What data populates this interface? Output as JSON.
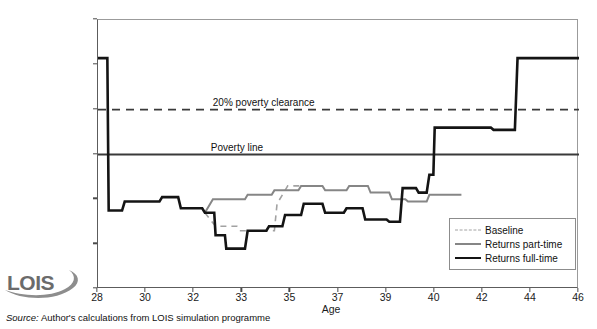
{
  "figure": {
    "title_partial": "",
    "source_prefix": "Source:",
    "source_text": "Author's calculations from LOIS simulation programme",
    "logo_text": "LOIS"
  },
  "legend": {
    "position": "bottom-right",
    "items": [
      {
        "label": "Baseline",
        "style": "dashed",
        "color": "#a2a2a2"
      },
      {
        "label": "Returns part-time",
        "style": "solid",
        "color": "#868686"
      },
      {
        "label": "Returns full-time",
        "style": "solid",
        "color": "#141414"
      }
    ]
  },
  "annotations": [
    {
      "text": "20% poverty clearance",
      "x": 34.2,
      "y": 123.5
    },
    {
      "text": "Poverty line",
      "x": 33.2,
      "y": 103.5
    }
  ],
  "chart_data": {
    "type": "line",
    "title": "",
    "xlabel": "Age",
    "ylabel": "% of AHC poverty line",
    "xlim": [
      28,
      46
    ],
    "ylim": [
      40,
      160
    ],
    "yticks": [
      40,
      60,
      80,
      100,
      120,
      140,
      160
    ],
    "xticks": [
      28,
      30,
      32,
      33,
      35,
      37,
      39,
      40,
      42,
      44,
      46
    ],
    "xtick_labels": [
      "28",
      "30",
      "32",
      "33",
      "35",
      "37",
      "39",
      "40",
      "42",
      "44",
      "46"
    ],
    "grid": false,
    "legend_position": "bottom-right",
    "reference_lines": [
      {
        "name": "20% poverty clearance",
        "value": 120,
        "style": "dashed",
        "color": "#3a3a3a"
      },
      {
        "name": "Poverty line",
        "value": 100,
        "style": "solid",
        "color": "#3a3a3a"
      }
    ],
    "series": [
      {
        "name": "Returns full-time",
        "color": "#141414",
        "style": "solid",
        "width": 2.6,
        "points": [
          [
            28.0,
            143
          ],
          [
            28.35,
            143
          ],
          [
            28.4,
            75
          ],
          [
            28.9,
            75
          ],
          [
            29.0,
            79
          ],
          [
            30.3,
            79
          ],
          [
            30.4,
            81
          ],
          [
            31.0,
            81
          ],
          [
            31.1,
            76
          ],
          [
            31.9,
            76
          ],
          [
            32.0,
            74
          ],
          [
            32.35,
            74
          ],
          [
            32.4,
            64
          ],
          [
            32.75,
            64
          ],
          [
            32.8,
            58
          ],
          [
            33.5,
            58
          ],
          [
            33.6,
            66
          ],
          [
            34.3,
            66
          ],
          [
            34.4,
            68
          ],
          [
            34.9,
            68
          ],
          [
            35.0,
            73
          ],
          [
            35.6,
            73
          ],
          [
            35.7,
            78
          ],
          [
            36.4,
            78
          ],
          [
            36.5,
            74
          ],
          [
            37.2,
            74
          ],
          [
            37.3,
            76
          ],
          [
            37.9,
            76
          ],
          [
            38.0,
            71
          ],
          [
            38.8,
            71
          ],
          [
            38.9,
            70
          ],
          [
            39.3,
            70
          ],
          [
            39.4,
            85
          ],
          [
            39.9,
            85
          ],
          [
            40.0,
            83
          ],
          [
            40.3,
            83
          ],
          [
            40.4,
            91
          ],
          [
            40.55,
            91
          ],
          [
            40.6,
            112
          ],
          [
            42.7,
            112
          ],
          [
            42.8,
            111
          ],
          [
            43.6,
            111
          ],
          [
            43.7,
            143
          ],
          [
            46.0,
            143
          ]
        ]
      },
      {
        "name": "Returns part-time",
        "color": "#868686",
        "style": "solid",
        "width": 2.0,
        "points": [
          [
            32.0,
            74
          ],
          [
            32.3,
            80
          ],
          [
            33.5,
            80
          ],
          [
            33.6,
            82
          ],
          [
            34.5,
            82
          ],
          [
            34.6,
            84
          ],
          [
            35.5,
            84
          ],
          [
            35.6,
            86
          ],
          [
            36.4,
            86
          ],
          [
            36.5,
            84
          ],
          [
            37.3,
            84
          ],
          [
            37.4,
            86
          ],
          [
            38.1,
            86
          ],
          [
            38.2,
            83
          ],
          [
            38.9,
            83
          ],
          [
            39.0,
            80
          ],
          [
            39.5,
            80
          ],
          [
            39.6,
            79
          ],
          [
            40.3,
            79
          ],
          [
            40.4,
            82
          ],
          [
            41.6,
            82
          ]
        ]
      },
      {
        "name": "Baseline",
        "color": "#a2a2a2",
        "style": "dashed",
        "width": 1.6,
        "points": [
          [
            32.0,
            74
          ],
          [
            32.4,
            68
          ],
          [
            33.2,
            68
          ],
          [
            33.3,
            66
          ],
          [
            34.6,
            66
          ],
          [
            34.7,
            78
          ],
          [
            35.1,
            86
          ],
          [
            35.6,
            86
          ]
        ]
      }
    ]
  }
}
